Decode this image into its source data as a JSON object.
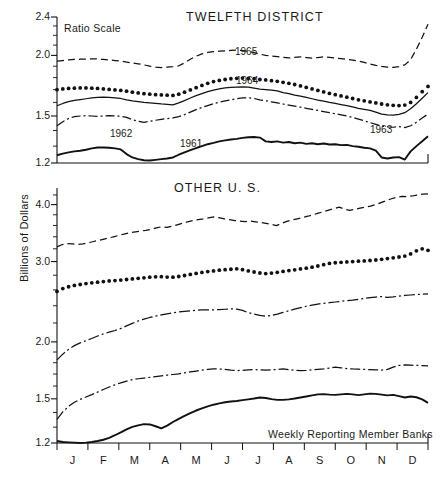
{
  "figure": {
    "y_axis_label": "Billions of Dollars",
    "width": 442,
    "height": 479,
    "ink_color": "#111111",
    "background": "#ffffff"
  },
  "panels": {
    "top": {
      "title": "TWELFTH DISTRICT",
      "scale_note": "Ratio Scale",
      "y_ticks": [
        "1.2",
        "1.5",
        "2.0",
        "2.4"
      ],
      "series_labels": [
        "1961",
        "1962",
        "1963",
        "1964",
        "1965"
      ]
    },
    "bottom": {
      "title": "OTHER U. S.",
      "source_note": "Weekly Reporting Member Banks",
      "y_ticks": [
        "1.2",
        "1.5",
        "2.0",
        "3.0",
        "4.0"
      ],
      "months": [
        "J",
        "F",
        "M",
        "A",
        "M",
        "J",
        "J",
        "A",
        "S",
        "O",
        "N",
        "D"
      ]
    }
  },
  "chart_data": [
    {
      "type": "line",
      "title": "TWELFTH DISTRICT",
      "subtitle": "Ratio Scale",
      "xlabel": "",
      "ylabel": "Billions of Dollars",
      "yscale": "log",
      "ylim": [
        1.2,
        2.4
      ],
      "yticks": [
        1.2,
        1.5,
        2.0,
        2.4
      ],
      "grid": false,
      "legend": "inline-annotations",
      "x": [
        "J",
        "F",
        "M",
        "A",
        "M",
        "J",
        "J",
        "A",
        "S",
        "O",
        "N",
        "D"
      ],
      "x_note": "weekly observations across one calendar year",
      "series": [
        {
          "name": "1961",
          "style": "solid-thick",
          "label_position": "mid",
          "values": [
            1.245,
            1.255,
            1.262,
            1.268,
            1.272,
            1.278,
            1.286,
            1.292,
            1.292,
            1.29,
            1.286,
            1.28,
            1.252,
            1.232,
            1.222,
            1.216,
            1.214,
            1.218,
            1.222,
            1.226,
            1.232,
            1.248,
            1.262,
            1.276,
            1.288,
            1.3,
            1.312,
            1.32,
            1.33,
            1.336,
            1.342,
            1.346,
            1.352,
            1.356,
            1.358,
            1.354,
            1.33,
            1.326,
            1.33,
            1.322,
            1.326,
            1.318,
            1.322,
            1.314,
            1.318,
            1.312,
            1.316,
            1.31,
            1.312,
            1.306,
            1.308,
            1.3,
            1.296,
            1.29,
            1.286,
            1.272,
            1.232,
            1.226,
            1.232,
            1.234,
            1.22,
            1.268,
            1.3,
            1.33,
            1.362
          ]
        },
        {
          "name": "1962",
          "style": "solid-thin",
          "label_position": "early",
          "values": [
            1.575,
            1.592,
            1.606,
            1.616,
            1.622,
            1.628,
            1.634,
            1.638,
            1.64,
            1.638,
            1.634,
            1.63,
            1.62,
            1.612,
            1.606,
            1.6,
            1.596,
            1.592,
            1.588,
            1.586,
            1.582,
            1.596,
            1.614,
            1.634,
            1.652,
            1.668,
            1.684,
            1.696,
            1.706,
            1.714,
            1.718,
            1.72,
            1.722,
            1.72,
            1.712,
            1.704,
            1.7,
            1.696,
            1.69,
            1.676,
            1.668,
            1.656,
            1.648,
            1.638,
            1.628,
            1.618,
            1.61,
            1.6,
            1.592,
            1.584,
            1.576,
            1.566,
            1.556,
            1.548,
            1.54,
            1.528,
            1.514,
            1.508,
            1.506,
            1.512,
            1.524,
            1.552,
            1.59,
            1.632,
            1.676
          ]
        },
        {
          "name": "1963",
          "style": "dash-dot",
          "label_position": "late",
          "values": [
            1.432,
            1.46,
            1.482,
            1.496,
            1.5,
            1.502,
            1.5,
            1.498,
            1.5,
            1.502,
            1.5,
            1.498,
            1.49,
            1.474,
            1.462,
            1.456,
            1.462,
            1.47,
            1.476,
            1.482,
            1.486,
            1.496,
            1.51,
            1.528,
            1.546,
            1.562,
            1.576,
            1.59,
            1.602,
            1.612,
            1.62,
            1.628,
            1.634,
            1.636,
            1.63,
            1.62,
            1.612,
            1.604,
            1.596,
            1.588,
            1.58,
            1.572,
            1.564,
            1.556,
            1.548,
            1.54,
            1.532,
            1.524,
            1.516,
            1.508,
            1.5,
            1.49,
            1.478,
            1.466,
            1.454,
            1.442,
            1.43,
            1.424,
            1.422,
            1.426,
            1.42,
            1.432,
            1.456,
            1.486,
            1.514
          ]
        },
        {
          "name": "1964",
          "style": "dotted",
          "label_position": "mid-right",
          "values": [
            1.7,
            1.706,
            1.71,
            1.712,
            1.714,
            1.714,
            1.712,
            1.71,
            1.706,
            1.702,
            1.698,
            1.694,
            1.688,
            1.68,
            1.674,
            1.668,
            1.664,
            1.66,
            1.658,
            1.656,
            1.654,
            1.664,
            1.68,
            1.698,
            1.716,
            1.734,
            1.752,
            1.766,
            1.776,
            1.784,
            1.79,
            1.794,
            1.796,
            1.794,
            1.79,
            1.784,
            1.78,
            1.774,
            1.768,
            1.76,
            1.752,
            1.742,
            1.73,
            1.718,
            1.706,
            1.694,
            1.682,
            1.67,
            1.66,
            1.65,
            1.64,
            1.63,
            1.62,
            1.612,
            1.604,
            1.596,
            1.588,
            1.582,
            1.578,
            1.576,
            1.58,
            1.6,
            1.638,
            1.684,
            1.726
          ]
        },
        {
          "name": "1965",
          "style": "dashed",
          "label_position": "upper",
          "values": [
            1.946,
            1.952,
            1.958,
            1.962,
            1.964,
            1.966,
            1.968,
            1.966,
            1.962,
            1.958,
            1.952,
            1.946,
            1.938,
            1.93,
            1.922,
            1.912,
            1.9,
            1.892,
            1.888,
            1.892,
            1.896,
            1.904,
            1.93,
            1.964,
            1.992,
            2.014,
            2.028,
            2.036,
            2.04,
            2.044,
            2.048,
            2.05,
            2.046,
            2.038,
            2.026,
            2.012,
            2.0,
            1.994,
            1.988,
            1.982,
            1.976,
            1.982,
            1.986,
            1.98,
            1.974,
            1.98,
            1.986,
            1.982,
            1.976,
            1.97,
            1.964,
            1.956,
            1.946,
            1.934,
            1.92,
            1.908,
            1.898,
            1.892,
            1.89,
            1.896,
            1.912,
            1.96,
            2.06,
            2.18,
            2.32
          ]
        }
      ]
    },
    {
      "type": "line",
      "title": "OTHER U. S.",
      "subtitle": "Weekly Reporting Member Banks",
      "xlabel": "",
      "ylabel": "Billions of Dollars",
      "yscale": "log",
      "ylim": [
        1.2,
        4.35
      ],
      "yticks": [
        1.2,
        1.5,
        2.0,
        3.0,
        4.0
      ],
      "grid": false,
      "legend": "none",
      "x": [
        "J",
        "F",
        "M",
        "A",
        "M",
        "J",
        "J",
        "A",
        "S",
        "O",
        "N",
        "D"
      ],
      "x_note": "weekly observations across one calendar year",
      "series": [
        {
          "name": "1961",
          "style": "solid-thick",
          "values": [
            1.212,
            1.206,
            1.204,
            1.202,
            1.2,
            1.202,
            1.206,
            1.212,
            1.22,
            1.232,
            1.248,
            1.266,
            1.286,
            1.302,
            1.312,
            1.32,
            1.318,
            1.306,
            1.292,
            1.31,
            1.334,
            1.356,
            1.376,
            1.396,
            1.414,
            1.43,
            1.444,
            1.456,
            1.466,
            1.474,
            1.48,
            1.484,
            1.49,
            1.496,
            1.502,
            1.51,
            1.506,
            1.498,
            1.492,
            1.492,
            1.496,
            1.502,
            1.51,
            1.518,
            1.526,
            1.534,
            1.536,
            1.532,
            1.53,
            1.534,
            1.538,
            1.534,
            1.528,
            1.534,
            1.54,
            1.538,
            1.532,
            1.526,
            1.53,
            1.52,
            1.51,
            1.518,
            1.512,
            1.496,
            1.47
          ]
        },
        {
          "name": "1962",
          "style": "dash-dot-low",
          "values": [
            1.352,
            1.404,
            1.444,
            1.474,
            1.496,
            1.514,
            1.532,
            1.552,
            1.572,
            1.592,
            1.61,
            1.626,
            1.64,
            1.652,
            1.66,
            1.666,
            1.672,
            1.678,
            1.684,
            1.69,
            1.696,
            1.702,
            1.71,
            1.718,
            1.726,
            1.734,
            1.74,
            1.744,
            1.744,
            1.74,
            1.734,
            1.73,
            1.732,
            1.736,
            1.738,
            1.736,
            1.734,
            1.736,
            1.74,
            1.744,
            1.738,
            1.732,
            1.73,
            1.732,
            1.736,
            1.74,
            1.744,
            1.752,
            1.76,
            1.754,
            1.748,
            1.744,
            1.742,
            1.74,
            1.738,
            1.736,
            1.734,
            1.74,
            1.76,
            1.776,
            1.78,
            1.778,
            1.776,
            1.774,
            1.772
          ]
        },
        {
          "name": "1963",
          "style": "dash-dot-mid",
          "values": [
            1.826,
            1.88,
            1.926,
            1.962,
            1.99,
            2.012,
            2.034,
            2.06,
            2.082,
            2.1,
            2.118,
            2.14,
            2.168,
            2.196,
            2.222,
            2.244,
            2.262,
            2.278,
            2.292,
            2.304,
            2.316,
            2.326,
            2.334,
            2.34,
            2.346,
            2.35,
            2.352,
            2.35,
            2.354,
            2.358,
            2.362,
            2.36,
            2.344,
            2.318,
            2.3,
            2.286,
            2.276,
            2.284,
            2.3,
            2.32,
            2.34,
            2.36,
            2.378,
            2.394,
            2.408,
            2.42,
            2.43,
            2.438,
            2.446,
            2.454,
            2.462,
            2.47,
            2.48,
            2.49,
            2.5,
            2.508,
            2.514,
            2.504,
            2.51,
            2.52,
            2.528,
            2.534,
            2.54,
            2.544,
            2.548
          ]
        },
        {
          "name": "1964",
          "style": "dotted",
          "values": [
            2.58,
            2.618,
            2.642,
            2.66,
            2.672,
            2.684,
            2.694,
            2.704,
            2.712,
            2.72,
            2.726,
            2.732,
            2.74,
            2.748,
            2.756,
            2.764,
            2.772,
            2.778,
            2.78,
            2.774,
            2.772,
            2.782,
            2.796,
            2.812,
            2.826,
            2.84,
            2.852,
            2.862,
            2.872,
            2.88,
            2.886,
            2.892,
            2.88,
            2.862,
            2.846,
            2.832,
            2.824,
            2.83,
            2.842,
            2.854,
            2.866,
            2.878,
            2.89,
            2.902,
            2.916,
            2.934,
            2.954,
            2.972,
            2.982,
            2.988,
            2.994,
            3.0,
            3.006,
            3.01,
            3.016,
            3.024,
            3.034,
            3.046,
            3.058,
            3.07,
            3.084,
            3.118,
            3.168,
            3.2,
            3.176
          ]
        },
        {
          "name": "1965",
          "style": "dashed",
          "values": [
            3.232,
            3.27,
            3.284,
            3.28,
            3.272,
            3.282,
            3.3,
            3.32,
            3.34,
            3.36,
            3.382,
            3.404,
            3.428,
            3.452,
            3.47,
            3.486,
            3.5,
            3.512,
            3.53,
            3.556,
            3.576,
            3.566,
            3.586,
            3.612,
            3.64,
            3.668,
            3.69,
            3.706,
            3.72,
            3.74,
            3.758,
            3.744,
            3.724,
            3.706,
            3.69,
            3.678,
            3.672,
            3.68,
            3.668,
            3.656,
            3.64,
            3.62,
            3.598,
            3.64,
            3.676,
            3.7,
            3.724,
            3.748,
            3.772,
            3.8,
            3.83,
            3.86,
            3.89,
            3.92,
            3.95,
            3.91,
            3.886,
            3.906,
            3.93,
            3.948,
            3.97,
            4.0,
            4.04,
            4.08,
            4.12,
            4.15,
            4.17,
            4.165,
            4.178,
            4.2,
            4.215,
            4.225
          ]
        }
      ]
    }
  ]
}
